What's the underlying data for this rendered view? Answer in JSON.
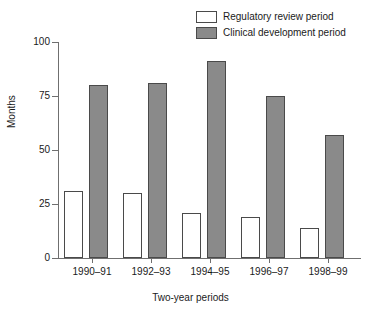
{
  "chart_data": {
    "type": "bar",
    "title": "",
    "xlabel": "Two-year periods",
    "ylabel": "Months",
    "categories": [
      "1990–91",
      "1992–93",
      "1994–95",
      "1996–97",
      "1998–99"
    ],
    "series": [
      {
        "name": "Regulatory review period",
        "color": "#ffffff",
        "edge_color": "#4a4a4a",
        "values": [
          31,
          30,
          21,
          19,
          14
        ]
      },
      {
        "name": "Clinical development period",
        "color": "#8a8a8a",
        "edge_color": "#4a4a4a",
        "values": [
          80,
          81,
          91,
          75,
          57
        ]
      }
    ],
    "ylim": [
      0,
      100
    ],
    "yticks": [
      0,
      25,
      50,
      75,
      100
    ],
    "ytick_labels": [
      "0",
      "25",
      "50",
      "75",
      "100"
    ],
    "grid": false,
    "legend_position": "top-right"
  }
}
